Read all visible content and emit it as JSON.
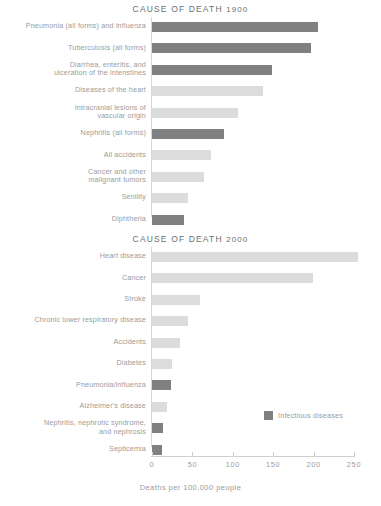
{
  "chart_data": [
    {
      "type": "bar",
      "orientation": "horizontal",
      "title": "CAUSE OF DEATH 1900",
      "title_prefix": "CAUSE OF DEATH",
      "title_year": "1900",
      "xlabel": "",
      "ylabel": "",
      "xlim": [
        0,
        250
      ],
      "grid": false,
      "categories": [
        "Pneumonia (all forms) and influenza",
        "Tuberculosis (all forms)",
        "Diarrhea, enteritis, and ulceration of the intenstines",
        "Diseases of the heart",
        "Intracranial lesions of vascular origin",
        "Nephritis (all forms)",
        "All accidents",
        "Cancer and other malignant tumors",
        "Senility",
        "Diphtheria"
      ],
      "category_lines": [
        [
          "Pneumonia (all forms) and influenza"
        ],
        [
          "Tuberculosis (all forms)"
        ],
        [
          "Diarrhea, enteritis, and",
          "ulceration of the intenstines"
        ],
        [
          "Diseases of the heart"
        ],
        [
          "Intracranial lesions of",
          "vascular origin"
        ],
        [
          "Nephritis (all forms)"
        ],
        [
          "All accidents"
        ],
        [
          "Cancer and other",
          "malignant tumors"
        ],
        [
          "Senility"
        ],
        [
          "Diphtheria"
        ]
      ],
      "values": [
        205,
        197,
        148,
        137,
        107,
        89,
        73,
        64,
        44,
        40
      ],
      "infectious": [
        true,
        true,
        true,
        false,
        false,
        true,
        false,
        false,
        false,
        true
      ]
    },
    {
      "type": "bar",
      "orientation": "horizontal",
      "title": "CAUSE OF DEATH 2000",
      "title_prefix": "CAUSE OF DEATH",
      "title_year": "2000",
      "xlabel": "Deaths per 100,000 people",
      "ylabel": "",
      "xlim": [
        0,
        250
      ],
      "grid": false,
      "categories": [
        "Heart disease",
        "Cancer",
        "Stroke",
        "Chronic lower respiratory disease",
        "Accidents",
        "Diabetes",
        "Pneumonia/influenza",
        "Alzheimer's disease",
        "Nephritis, nephrotic syndrome, and nephrosis",
        "Septicemia"
      ],
      "category_lines": [
        [
          "Heart disease"
        ],
        [
          "Cancer"
        ],
        [
          "Stroke"
        ],
        [
          "Chronic lower respiratory disease"
        ],
        [
          "Accidents"
        ],
        [
          "Diabetes"
        ],
        [
          "Pneumonia/influenza"
        ],
        [
          "Alzheimer's disease"
        ],
        [
          "Nephritis, nephrotic syndrome,",
          "and nephrosis"
        ],
        [
          "Septicemia"
        ]
      ],
      "values": [
        255,
        199,
        60,
        44,
        35,
        25,
        24,
        18,
        14,
        12
      ],
      "infectious": [
        false,
        false,
        false,
        false,
        false,
        false,
        true,
        false,
        true,
        true
      ],
      "legend": {
        "position": "inside-right",
        "entries": [
          {
            "label": "Infectious diseases",
            "color": "#808080"
          }
        ]
      }
    }
  ],
  "axis": {
    "ticks": [
      0,
      50,
      100,
      150,
      200,
      250
    ],
    "tick_labels": [
      "0",
      "50",
      "100",
      "150",
      "200",
      "250"
    ],
    "title": "Deaths per 100,000 people",
    "min": 0,
    "max": 250
  },
  "colors": {
    "infectious_bar": "#808080",
    "other_bar": "#dcdcdc",
    "label_text": "#9b9b9b",
    "title_text": "#6e6e6e",
    "axis_line": "#cfcfcf",
    "background": "#ffffff"
  },
  "legend": {
    "label": "Infectious diseases",
    "swatch_color": "#808080"
  }
}
